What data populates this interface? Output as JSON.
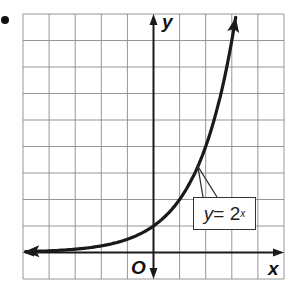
{
  "chart_data": {
    "type": "line",
    "title": "",
    "xlabel": "x",
    "ylabel": "y",
    "origin_label": "O",
    "xlim": [
      -5,
      5
    ],
    "ylim": [
      -1,
      9
    ],
    "grid": true,
    "grid_step": 1,
    "series": [
      {
        "name": "y = 2^x",
        "function": "2^x",
        "x": [
          -5,
          -4,
          -3,
          -2,
          -1,
          0,
          1,
          2,
          3,
          3.15
        ],
        "y": [
          0.03125,
          0.0625,
          0.125,
          0.25,
          0.5,
          1,
          2,
          4,
          8,
          8.9
        ],
        "arrows": "both"
      }
    ],
    "annotations": [
      {
        "text_var": "y",
        "text_eq": " = 2",
        "text_exp": "x",
        "points_to": [
          1.7,
          3.2
        ]
      }
    ]
  },
  "labels": {
    "x_axis": "x",
    "y_axis": "y",
    "origin": "O",
    "eq_var": "y",
    "eq_mid": " = 2",
    "eq_exp": "x"
  },
  "colors": {
    "grid": "#8a8a8a",
    "axis": "#1a1a1a",
    "curve": "#1a1a1a"
  }
}
